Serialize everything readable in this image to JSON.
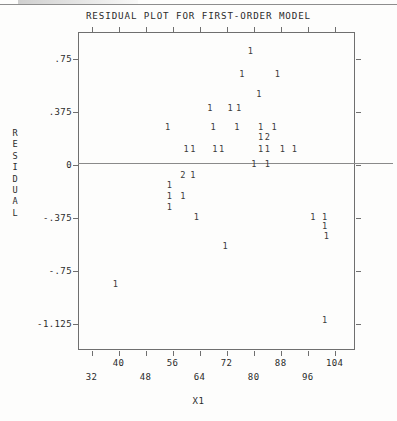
{
  "page": {
    "background_color": "#fdfdfc",
    "ink_color": "#2b2b2b"
  },
  "chart_data": {
    "type": "scatter",
    "title": "RESIDUAL PLOT FOR FIRST-ORDER MODEL",
    "xlabel": "X1",
    "ylabel": "RESIDUAL",
    "ylabel_letters": [
      "R",
      "E",
      "S",
      "I",
      "D",
      "U",
      "A",
      "L"
    ],
    "grid": false,
    "legend": null,
    "zero_reference_line": 0,
    "xlim": [
      28,
      110
    ],
    "ylim": [
      -1.3125,
      0.9375
    ],
    "x_ticks": [
      32,
      40,
      48,
      56,
      64,
      72,
      80,
      88,
      96,
      104
    ],
    "x_tick_labels": [
      "32",
      "40",
      "48",
      "56",
      "64",
      "72",
      "80",
      "88",
      "96",
      "104"
    ],
    "y_ticks": [
      0.75,
      0.375,
      0,
      -0.375,
      -0.75,
      -1.125
    ],
    "y_tick_labels": [
      ".75",
      ".375",
      "0",
      "-.375",
      "-.75",
      "-1.125"
    ],
    "marker_style": "count-digit",
    "marker_note": "Each plotted glyph is a digit giving the number of observations at that location (1 = one point, 2 = two overlapping points).",
    "points": [
      {
        "label": "1",
        "x": 79.0,
        "y": 0.8,
        "count": 1
      },
      {
        "label": "1",
        "x": 76.5,
        "y": 0.64,
        "count": 1
      },
      {
        "label": "1",
        "x": 87.0,
        "y": 0.64,
        "count": 1
      },
      {
        "label": "1",
        "x": 81.5,
        "y": 0.5,
        "count": 1
      },
      {
        "label": "1",
        "x": 67.0,
        "y": 0.4,
        "count": 1
      },
      {
        "label": "1",
        "x": 73.0,
        "y": 0.4,
        "count": 1
      },
      {
        "label": "1",
        "x": 75.5,
        "y": 0.4,
        "count": 1
      },
      {
        "label": "1",
        "x": 54.5,
        "y": 0.265,
        "count": 1
      },
      {
        "label": "1",
        "x": 68.0,
        "y": 0.265,
        "count": 1
      },
      {
        "label": "1",
        "x": 75.0,
        "y": 0.265,
        "count": 1
      },
      {
        "label": "1",
        "x": 82.0,
        "y": 0.265,
        "count": 1
      },
      {
        "label": "1",
        "x": 86.0,
        "y": 0.265,
        "count": 1
      },
      {
        "label": "1",
        "x": 82.0,
        "y": 0.195,
        "count": 1
      },
      {
        "label": "2",
        "x": 84.0,
        "y": 0.195,
        "count": 2
      },
      {
        "label": "1",
        "x": 60.0,
        "y": 0.11,
        "count": 1
      },
      {
        "label": "1",
        "x": 62.0,
        "y": 0.11,
        "count": 1
      },
      {
        "label": "1",
        "x": 68.5,
        "y": 0.11,
        "count": 1
      },
      {
        "label": "1",
        "x": 70.5,
        "y": 0.11,
        "count": 1
      },
      {
        "label": "1",
        "x": 82.0,
        "y": 0.11,
        "count": 1
      },
      {
        "label": "1",
        "x": 84.0,
        "y": 0.11,
        "count": 1
      },
      {
        "label": "1",
        "x": 88.5,
        "y": 0.11,
        "count": 1
      },
      {
        "label": "1",
        "x": 92.0,
        "y": 0.11,
        "count": 1
      },
      {
        "label": "1",
        "x": 80.0,
        "y": 0.0,
        "count": 1
      },
      {
        "label": "1",
        "x": 84.0,
        "y": 0.0,
        "count": 1
      },
      {
        "label": "2",
        "x": 59.0,
        "y": -0.075,
        "count": 2
      },
      {
        "label": "1",
        "x": 62.0,
        "y": -0.075,
        "count": 1
      },
      {
        "label": "1",
        "x": 55.0,
        "y": -0.15,
        "count": 1
      },
      {
        "label": "1",
        "x": 55.0,
        "y": -0.225,
        "count": 1
      },
      {
        "label": "1",
        "x": 59.0,
        "y": -0.225,
        "count": 1
      },
      {
        "label": "1",
        "x": 55.0,
        "y": -0.3,
        "count": 1
      },
      {
        "label": "1",
        "x": 63.0,
        "y": -0.375,
        "count": 1
      },
      {
        "label": "1",
        "x": 97.5,
        "y": -0.375,
        "count": 1
      },
      {
        "label": "1",
        "x": 101.0,
        "y": -0.375,
        "count": 1
      },
      {
        "label": "1",
        "x": 101.0,
        "y": -0.44,
        "count": 1
      },
      {
        "label": "1",
        "x": 101.5,
        "y": -0.51,
        "count": 1
      },
      {
        "label": "1",
        "x": 71.5,
        "y": -0.58,
        "count": 1
      },
      {
        "label": "1",
        "x": 39.0,
        "y": -0.85,
        "count": 1
      },
      {
        "label": "1",
        "x": 101.0,
        "y": -1.105,
        "count": 1
      }
    ]
  }
}
